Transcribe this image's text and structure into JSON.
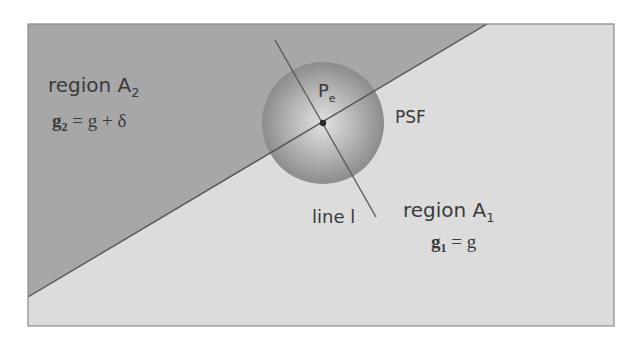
{
  "diagram": {
    "type": "edge-psf-illustration",
    "colors": {
      "background": "#ffffff",
      "region_a2_fill": "#a7a7a7",
      "region_a1_fill": "#dcdcdc",
      "frame_stroke": "#8a8a8a",
      "edge_line": "#555555",
      "line_l": "#555555",
      "psf_center": "#d9d9d9",
      "psf_edge": "#8c8c8c",
      "point_dot": "#2a2a2a",
      "text": "#3a3a3a"
    },
    "labels": {
      "region_a2": {
        "text": "region A",
        "sub": "2"
      },
      "region_a2_eq": {
        "lhs": "g",
        "lhs_sub": "2",
        "rhs": " = g + δ"
      },
      "region_a1": {
        "text": "region A",
        "sub": "1"
      },
      "region_a1_eq": {
        "lhs": "g",
        "lhs_sub": "1",
        "rhs": " = g"
      },
      "point": {
        "text": "P",
        "sub": "e"
      },
      "psf": "PSF",
      "line": "line l"
    },
    "geometry": {
      "frame": {
        "x": 28,
        "y": 24,
        "width": 586,
        "height": 302
      },
      "edge_line": {
        "x1": 28,
        "y1": 297,
        "x2": 487,
        "y2": 24
      },
      "psf_circle": {
        "cx": 323,
        "cy": 123,
        "r": 61
      },
      "line_l": {
        "x1": 275,
        "y1": 40,
        "x2": 376,
        "y2": 217
      },
      "point_pe": {
        "cx": 323,
        "cy": 123,
        "r": 3.2
      }
    }
  }
}
